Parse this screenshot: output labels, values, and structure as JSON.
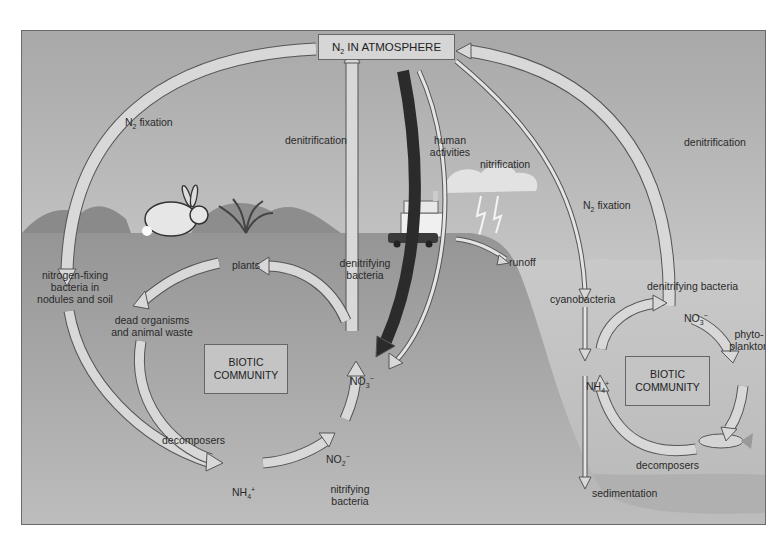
{
  "diagram": {
    "title_box": {
      "prefix": "N",
      "sub": "2",
      "suffix": " IN ATMOSPHERE"
    },
    "colors": {
      "sky_top": "#a9a9a9",
      "sky_bottom": "#e2e2e2",
      "land": "#9e9e9e",
      "water": "#c8c8c8",
      "arrow_fill": "#d8d8d8",
      "arrow_stroke": "#555555",
      "human_arrow": "#2b2b2b",
      "box_fill": "#c4c4c4"
    },
    "terrestrial": {
      "n2_fixation": {
        "prefix": "N",
        "sub": "2",
        "suffix": " fixation"
      },
      "denitrification": "denitrification",
      "human_activities_1": "human",
      "human_activities_2": "activities",
      "nitrification": "nitrification",
      "nitrogen_fixing_1": "nitrogen-fixing",
      "nitrogen_fixing_2": "bacteria in",
      "nitrogen_fixing_3": "nodules and soil",
      "plants": "plants",
      "denitrifying_1": "denitrifying",
      "denitrifying_2": "bacteria",
      "dead_organisms_1": "dead organisms",
      "dead_organisms_2": "and animal waste",
      "biotic_1": "BIOTIC",
      "biotic_2": "COMMUNITY",
      "no3": {
        "base": "NO",
        "sub": "3",
        "sup": "−"
      },
      "no2": {
        "base": "NO",
        "sub": "2",
        "sup": "−"
      },
      "nh4": {
        "base": "NH",
        "sub": "4",
        "sup": "+"
      },
      "decomposers": "decomposers",
      "nitrifying_1": "nitrifying",
      "nitrifying_2": "bacteria",
      "runoff": "runoff"
    },
    "aquatic": {
      "n2_fixation": {
        "prefix": "N",
        "sub": "2",
        "suffix": " fixation"
      },
      "denitrification": "denitrification",
      "denitrifying_bacteria": "denitrifying bacteria",
      "cyanobacteria": "cyanobacteria",
      "no3": {
        "base": "NO",
        "sub": "3",
        "sup": "−"
      },
      "nh4": {
        "base": "NH",
        "sub": "4",
        "sup": "+"
      },
      "phyto_1": "phyto-",
      "phyto_2": "plankton",
      "biotic_1": "BIOTIC",
      "biotic_2": "COMMUNITY",
      "decomposers": "decomposers",
      "sedimentation": "sedimentation"
    }
  }
}
